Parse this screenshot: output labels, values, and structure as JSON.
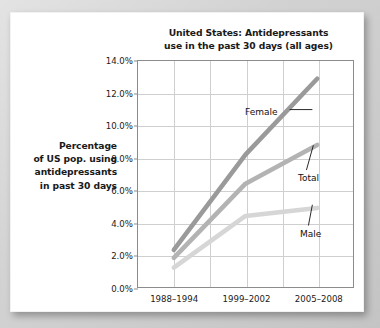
{
  "chart_data": {
    "type": "line",
    "title": "United States: Antidepressants use in the past 30 days (all ages)",
    "title_line1": "United States: Antidepressants",
    "title_line2": "use in the past 30 days (all ages)",
    "ylabel": "Percentage of US pop. using antidepressants in past 30 days",
    "ylabel_lines": [
      "Percentage",
      "of US pop. using",
      "antidepressants",
      "in past 30 days"
    ],
    "xlabel": "",
    "categories": [
      "1988–1994",
      "1999–2002",
      "2005–2008"
    ],
    "ylim": [
      0,
      14
    ],
    "ytick_values": [
      0,
      2,
      4,
      6,
      8,
      10,
      12,
      14
    ],
    "ytick_labels": [
      "0.0%",
      "2.0%",
      "4.0%",
      "6.0%",
      "8.0%",
      "10.0%",
      "12.0%",
      "14.0%"
    ],
    "grid": "both",
    "legend": "annotations",
    "series": [
      {
        "name": "Female",
        "values": [
          2.3,
          8.2,
          12.9
        ],
        "color": "#9a9a9a"
      },
      {
        "name": "Total",
        "values": [
          1.8,
          6.4,
          8.8
        ],
        "color": "#b3b3b3"
      },
      {
        "name": "Male",
        "values": [
          1.2,
          4.4,
          4.9
        ],
        "color": "#d6d6d6"
      }
    ],
    "annotations": [
      {
        "label": "Female",
        "series": "Female"
      },
      {
        "label": "Total",
        "series": "Total"
      },
      {
        "label": "Male",
        "series": "Male"
      }
    ]
  }
}
